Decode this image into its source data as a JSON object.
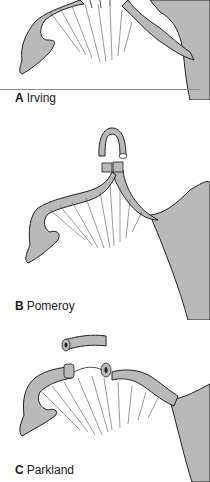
{
  "figure": {
    "panels": [
      {
        "letter": "A",
        "name": "Irving"
      },
      {
        "letter": "B",
        "name": "Pomeroy"
      },
      {
        "letter": "C",
        "name": "Parkland"
      }
    ]
  },
  "colors": {
    "tissue_fill": "#b9b9b9",
    "outline": "#222222",
    "background": "#ffffff",
    "divider": "#8a8a8a"
  }
}
